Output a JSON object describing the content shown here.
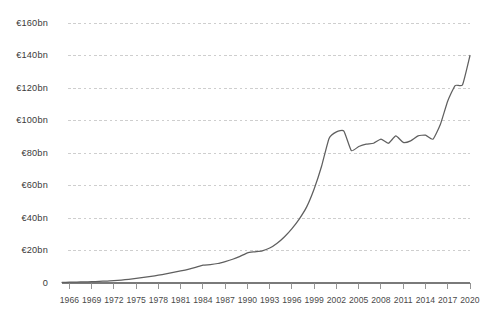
{
  "chart_data": {
    "type": "line",
    "title": "",
    "subtitle": "",
    "xlabel": "",
    "ylabel": "",
    "xlim": [
      1965,
      2020
    ],
    "ylim": [
      0,
      160
    ],
    "grid": true,
    "legend": null,
    "y_tick_labels": [
      "€160bn",
      "€140bn",
      "€120bn",
      "€100bn",
      "€80bn",
      "€60bn",
      "€40bn",
      "€20bn",
      "0"
    ],
    "y_tick_values": [
      160,
      140,
      120,
      100,
      80,
      60,
      40,
      20,
      0
    ],
    "x_tick_labels": [
      "1966",
      "1969",
      "1972",
      "1975",
      "1978",
      "1981",
      "1984",
      "1987",
      "1990",
      "1993",
      "1996",
      "1999",
      "2002",
      "2005",
      "2008",
      "2011",
      "2014",
      "2017",
      "2020"
    ],
    "x_tick_values": [
      1966,
      1969,
      1972,
      1975,
      1978,
      1981,
      1984,
      1987,
      1990,
      1993,
      1996,
      1999,
      2002,
      2005,
      2008,
      2011,
      2014,
      2017,
      2020
    ],
    "x_tick_step": 3,
    "unit": "€bn",
    "series": [
      {
        "name": "value",
        "color": "#5f5f5f",
        "x": [
          1965,
          1966,
          1967,
          1968,
          1969,
          1970,
          1971,
          1972,
          1973,
          1974,
          1975,
          1976,
          1977,
          1978,
          1979,
          1980,
          1981,
          1982,
          1983,
          1984,
          1985,
          1986,
          1987,
          1988,
          1989,
          1990,
          1991,
          1992,
          1993,
          1994,
          1995,
          1996,
          1997,
          1998,
          1999,
          2000,
          2001,
          2002,
          2003,
          2004,
          2005,
          2006,
          2007,
          2008,
          2009,
          2010,
          2011,
          2012,
          2013,
          2014,
          2015,
          2016,
          2017,
          2018,
          2019,
          2020
        ],
        "values": [
          0.4,
          0.5,
          0.6,
          0.7,
          0.8,
          1.0,
          1.2,
          1.4,
          1.8,
          2.3,
          2.8,
          3.4,
          4.1,
          4.8,
          5.6,
          6.5,
          7.4,
          8.4,
          9.6,
          11.0,
          11.3,
          12.0,
          13.2,
          14.6,
          16.4,
          18.6,
          19.2,
          19.8,
          21.5,
          24.5,
          28.5,
          33.5,
          39.5,
          47.0,
          58.0,
          72.0,
          89.0,
          93.0,
          93.5,
          81.5,
          84.0,
          85.5,
          86.0,
          88.5,
          86.0,
          90.5,
          86.5,
          87.5,
          90.5,
          91.0,
          88.5,
          97.5,
          112.0,
          121.5,
          122.0,
          140.0
        ]
      }
    ],
    "annotations": []
  },
  "axis": {
    "y_axis_name": "y-axis",
    "x_axis_name": "x-axis"
  }
}
